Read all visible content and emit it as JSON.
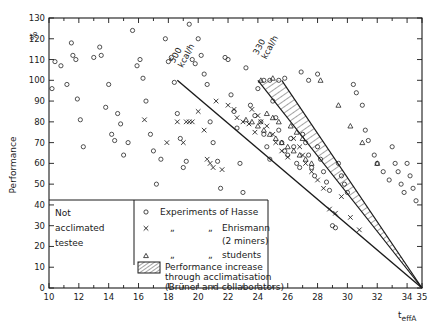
{
  "chart_data": {
    "type": "scatter",
    "title": "",
    "xlabel": "t effA",
    "xlabel_main": "t",
    "xlabel_sub": "effA",
    "ylabel": "Performance",
    "yunit": "%",
    "xlim": [
      10,
      35
    ],
    "ylim": [
      0,
      130
    ],
    "xticks": [
      10,
      12,
      14,
      16,
      18,
      20,
      22,
      24,
      26,
      28,
      30,
      32,
      34,
      35
    ],
    "xtick_labels": [
      "10",
      "12",
      "14",
      "16",
      "18",
      "20",
      "22",
      "24",
      "26",
      "28",
      "30",
      "32",
      "34",
      "35"
    ],
    "xtick_minor_step": 1,
    "yticks": [
      0,
      10,
      20,
      30,
      40,
      50,
      60,
      70,
      80,
      90,
      100,
      110,
      120,
      130
    ],
    "ytick_labels": [
      "0",
      "10",
      "20",
      "30",
      "40",
      "50",
      "60",
      "70",
      "80",
      "90",
      "100",
      "110",
      "120",
      "130"
    ],
    "grid": false,
    "legend_position": "inside-bottom-left",
    "annotations": [
      {
        "name": "line-label-500",
        "text_line1": "500",
        "text_line2": "kcal/h",
        "x": 18.4,
        "y": 108,
        "rotation": -62
      },
      {
        "name": "line-label-330",
        "text_line1": "330",
        "text_line2": "kcal/h",
        "x": 24.0,
        "y": 112,
        "rotation": -62
      }
    ],
    "trend_lines": [
      {
        "name": "line-500-kcal",
        "label": "500 kcal/h",
        "x1": 18.6,
        "y1": 100,
        "x2": 35.0,
        "y2": 0
      }
    ],
    "bands": [
      {
        "name": "acclimatisation-band",
        "label": "330 kcal/h",
        "hatched": true,
        "upper_x1": 24.0,
        "upper_y1": 100,
        "upper_x2": 35.0,
        "upper_y2": 0,
        "lower_x1": 25.6,
        "lower_y1": 100,
        "lower_x2": 35.0,
        "lower_y2": 0
      }
    ],
    "series": [
      {
        "name": "Experiments of Hasse",
        "marker": "circle",
        "points": [
          [
            10.2,
            96
          ],
          [
            10.4,
            109
          ],
          [
            10.8,
            107
          ],
          [
            11.2,
            98
          ],
          [
            11.5,
            118
          ],
          [
            11.6,
            112
          ],
          [
            11.8,
            110
          ],
          [
            11.9,
            91
          ],
          [
            12.1,
            81
          ],
          [
            12.3,
            68
          ],
          [
            13.0,
            111
          ],
          [
            13.4,
            116
          ],
          [
            13.5,
            112
          ],
          [
            13.8,
            87
          ],
          [
            14.0,
            98
          ],
          [
            14.2,
            74
          ],
          [
            14.4,
            71
          ],
          [
            14.6,
            84
          ],
          [
            14.8,
            79
          ],
          [
            15.0,
            64
          ],
          [
            15.3,
            70
          ],
          [
            15.6,
            124
          ],
          [
            15.9,
            107
          ],
          [
            16.1,
            110
          ],
          [
            16.3,
            101
          ],
          [
            16.5,
            90
          ],
          [
            16.8,
            74
          ],
          [
            17.0,
            66
          ],
          [
            17.2,
            50
          ],
          [
            17.5,
            62
          ],
          [
            17.8,
            120
          ],
          [
            18.0,
            109
          ],
          [
            18.2,
            111
          ],
          [
            18.4,
            99
          ],
          [
            18.6,
            84
          ],
          [
            18.8,
            72
          ],
          [
            19.0,
            58
          ],
          [
            19.2,
            61
          ],
          [
            19.4,
            127
          ],
          [
            19.6,
            110
          ],
          [
            19.8,
            108
          ],
          [
            20.0,
            120
          ],
          [
            20.2,
            112
          ],
          [
            20.4,
            103
          ],
          [
            20.6,
            98
          ],
          [
            20.8,
            80
          ],
          [
            21.0,
            70
          ],
          [
            21.3,
            61
          ],
          [
            21.5,
            48
          ],
          [
            21.8,
            111
          ],
          [
            22.0,
            110
          ],
          [
            22.2,
            93
          ],
          [
            22.4,
            85
          ],
          [
            22.6,
            77
          ],
          [
            22.8,
            60
          ],
          [
            23.0,
            46
          ],
          [
            23.2,
            106
          ],
          [
            23.5,
            88
          ],
          [
            23.8,
            83
          ],
          [
            24.0,
            96
          ],
          [
            24.2,
            80
          ],
          [
            24.4,
            74
          ],
          [
            24.6,
            68
          ],
          [
            24.8,
            62
          ],
          [
            25.0,
            90
          ],
          [
            25.2,
            82
          ],
          [
            25.4,
            76
          ],
          [
            25.6,
            70
          ],
          [
            25.8,
            66
          ],
          [
            26.0,
            64
          ],
          [
            26.2,
            72
          ],
          [
            26.4,
            68
          ],
          [
            26.6,
            60
          ],
          [
            26.8,
            58
          ],
          [
            27.0,
            74
          ],
          [
            27.2,
            70
          ],
          [
            27.4,
            64
          ],
          [
            27.6,
            58
          ],
          [
            27.8,
            54
          ],
          [
            28.0,
            68
          ],
          [
            28.2,
            62
          ],
          [
            28.4,
            56
          ],
          [
            28.6,
            51
          ],
          [
            28.8,
            47
          ],
          [
            29.0,
            30
          ],
          [
            29.2,
            29
          ],
          [
            29.4,
            60
          ],
          [
            29.6,
            54
          ],
          [
            29.8,
            50
          ],
          [
            30.0,
            46
          ],
          [
            30.4,
            98
          ],
          [
            30.6,
            94
          ],
          [
            31.0,
            88
          ],
          [
            31.2,
            76
          ],
          [
            31.4,
            71
          ],
          [
            31.8,
            64
          ],
          [
            32.0,
            60
          ],
          [
            32.4,
            56
          ],
          [
            32.8,
            52
          ],
          [
            33.0,
            68
          ],
          [
            33.2,
            60
          ],
          [
            33.4,
            56
          ],
          [
            33.6,
            50
          ],
          [
            33.8,
            46
          ],
          [
            34.0,
            60
          ],
          [
            34.2,
            54
          ],
          [
            34.4,
            48
          ],
          [
            34.6,
            42
          ],
          [
            26.9,
            104
          ],
          [
            27.4,
            100
          ],
          [
            28.0,
            103
          ],
          [
            25.4,
            100
          ],
          [
            25.8,
            101
          ],
          [
            24.8,
            100
          ],
          [
            24.4,
            100
          ]
        ]
      },
      {
        "name": "Ehrismann (2 miners)",
        "marker": "cross",
        "points": [
          [
            16.4,
            81
          ],
          [
            18.6,
            80
          ],
          [
            19.2,
            80
          ],
          [
            19.4,
            80
          ],
          [
            19.6,
            80
          ],
          [
            17.9,
            70
          ],
          [
            19.0,
            70
          ],
          [
            20.4,
            76
          ],
          [
            20.6,
            62
          ],
          [
            20.8,
            60
          ],
          [
            21.0,
            58
          ],
          [
            21.6,
            57
          ],
          [
            22.4,
            86
          ],
          [
            22.6,
            82
          ],
          [
            23.0,
            80
          ],
          [
            23.4,
            79
          ],
          [
            23.8,
            75
          ],
          [
            24.0,
            83
          ],
          [
            24.2,
            80
          ],
          [
            24.6,
            78
          ],
          [
            25.0,
            74
          ],
          [
            25.2,
            70
          ],
          [
            25.6,
            66
          ],
          [
            26.0,
            63
          ],
          [
            26.4,
            72
          ],
          [
            26.8,
            68
          ],
          [
            27.0,
            64
          ],
          [
            27.2,
            60
          ],
          [
            27.6,
            56
          ],
          [
            28.0,
            52
          ],
          [
            28.4,
            48
          ],
          [
            28.8,
            38
          ],
          [
            29.2,
            36
          ],
          [
            29.6,
            44
          ],
          [
            30.2,
            34
          ],
          [
            30.8,
            28
          ],
          [
            21.2,
            90
          ],
          [
            22.0,
            88
          ],
          [
            20.0,
            85
          ],
          [
            23.6,
            86
          ]
        ]
      },
      {
        "name": "students",
        "marker": "triangle",
        "points": [
          [
            23.2,
            81
          ],
          [
            23.6,
            80
          ],
          [
            24.0,
            78
          ],
          [
            24.4,
            76
          ],
          [
            24.8,
            74
          ],
          [
            25.2,
            72
          ],
          [
            25.6,
            70
          ],
          [
            26.0,
            68
          ],
          [
            26.4,
            66
          ],
          [
            26.8,
            64
          ],
          [
            27.2,
            62
          ],
          [
            27.6,
            60
          ],
          [
            24.6,
            84
          ],
          [
            25.0,
            82
          ],
          [
            25.4,
            80
          ],
          [
            26.2,
            78
          ],
          [
            26.6,
            75
          ],
          [
            27.0,
            72
          ],
          [
            28.2,
            100
          ],
          [
            29.4,
            88
          ],
          [
            30.2,
            78
          ],
          [
            31.0,
            70
          ],
          [
            32.0,
            60
          ],
          [
            24.2,
            100
          ],
          [
            25.0,
            101
          ]
        ]
      }
    ]
  },
  "axes": {
    "y_title": "Performance",
    "y_unit": "%",
    "x_title_main": "t",
    "x_title_sub": "effA"
  },
  "not_acclimated_box": {
    "line1": "Not",
    "line2": "acclimated",
    "line3": "testee"
  },
  "legend": {
    "entries": [
      {
        "marker": "circle",
        "col1": "Experiments of Hasse",
        "col2": "",
        "col3": "",
        "extra": ""
      },
      {
        "marker": "cross",
        "col1": "„",
        "col2": "„",
        "col3": "Ehrismann",
        "extra": "(2 miners)"
      },
      {
        "marker": "triangle",
        "col1": "„",
        "col2": "„",
        "col3": "students",
        "extra": ""
      }
    ],
    "band_entry": {
      "line1": "Performance increase",
      "line2": "through acclimatisation",
      "line3": "(Brüner and collaborators)"
    }
  },
  "colors": {
    "ink": "#1a1a1a",
    "background": "#ffffff",
    "hatch": "#1a1a1a"
  }
}
